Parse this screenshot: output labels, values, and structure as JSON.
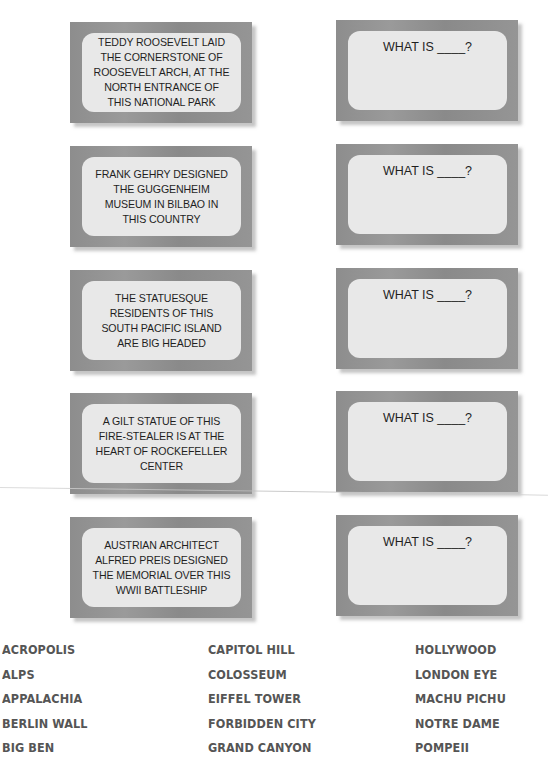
{
  "clues": [
    {
      "text": "TEDDY ROOSEVELT LAID\nTHE CORNERSTONE OF\nROOSEVELT ARCH, AT THE\nNORTH ENTRANCE OF\nTHIS NATIONAL PARK"
    },
    {
      "text": "FRANK GEHRY DESIGNED\nTHE GUGGENHEIM\nMUSEUM IN BILBAO IN\nTHIS COUNTRY"
    },
    {
      "text": "THE STATUESQUE\nRESIDENTS OF THIS\nSOUTH PACIFIC ISLAND\nARE BIG HEADED"
    },
    {
      "text": "A GILT STATUE OF THIS\nFIRE-STEALER IS AT THE\nHEART OF ROCKEFELLER\nCENTER"
    },
    {
      "text": "AUSTRIAN ARCHITECT\nALFRED PREIS DESIGNED\nTHE MEMORIAL OVER THIS\nWWII BATTLESHIP"
    }
  ],
  "answers": [
    {
      "prompt": "WHAT IS ____?"
    },
    {
      "prompt": "WHAT IS ____?"
    },
    {
      "prompt": "WHAT IS ____?"
    },
    {
      "prompt": "WHAT IS ____?"
    },
    {
      "prompt": "WHAT IS ____?"
    }
  ],
  "word_bank": {
    "columns": [
      [
        "ACROPOLIS",
        "ALPS",
        "APPALACHIA",
        "BERLIN WALL",
        "BIG BEN"
      ],
      [
        "CAPITOL HILL",
        "COLOSSEUM",
        "EIFFEL TOWER",
        "FORBIDDEN CITY",
        "GRAND CANYON"
      ],
      [
        "HOLLYWOOD",
        "LONDON EYE",
        "MACHU PICHU",
        "NOTRE DAME",
        "POMPEII"
      ]
    ]
  },
  "colors": {
    "card_frame": "#8f8f8f",
    "card_face": "#e8e8e8",
    "card_text": "#1f1f1f",
    "word_bank_text": "#555555"
  }
}
